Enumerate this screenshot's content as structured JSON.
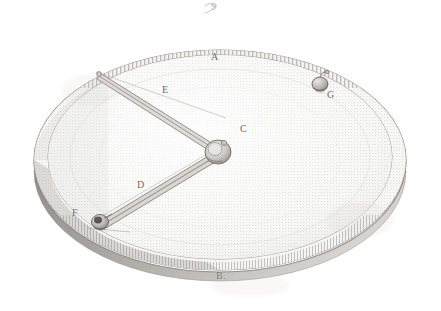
{
  "plate": {
    "figure_caption": "9",
    "background_color": "#ffffff",
    "ink_color": "#6d6a68",
    "paper_tone": "#f7f6f4"
  },
  "labels": [
    {
      "key": "A",
      "text": "A",
      "role": "rim-point-top",
      "x": 211,
      "y": 57
    },
    {
      "key": "B",
      "text": "B.",
      "role": "rim-point-bottom",
      "x": 218,
      "y": 277
    },
    {
      "key": "C",
      "text": "C",
      "role": "center-hub",
      "x": 240,
      "y": 127
    },
    {
      "key": "D",
      "text": "D",
      "role": "lower-arm",
      "x": 138,
      "y": 184
    },
    {
      "key": "E",
      "text": "E",
      "role": "upper-arm",
      "x": 163,
      "y": 89
    },
    {
      "key": "F",
      "text": "F",
      "role": "lower-weight",
      "x": 73,
      "y": 212
    },
    {
      "key": "G",
      "text": "G",
      "role": "upper-right-weight",
      "x": 327,
      "y": 95
    }
  ],
  "figure_elements": {
    "disc_name": "graduated-disc",
    "rim_name": "graduated-rim",
    "hub_name": "center-hub",
    "upper_arm_name": "upper-radial-arm",
    "lower_arm_name": "lower-radial-arm",
    "lower_weight_name": "lower-weight-bob",
    "upper_weight_name": "upper-weight-bob"
  }
}
